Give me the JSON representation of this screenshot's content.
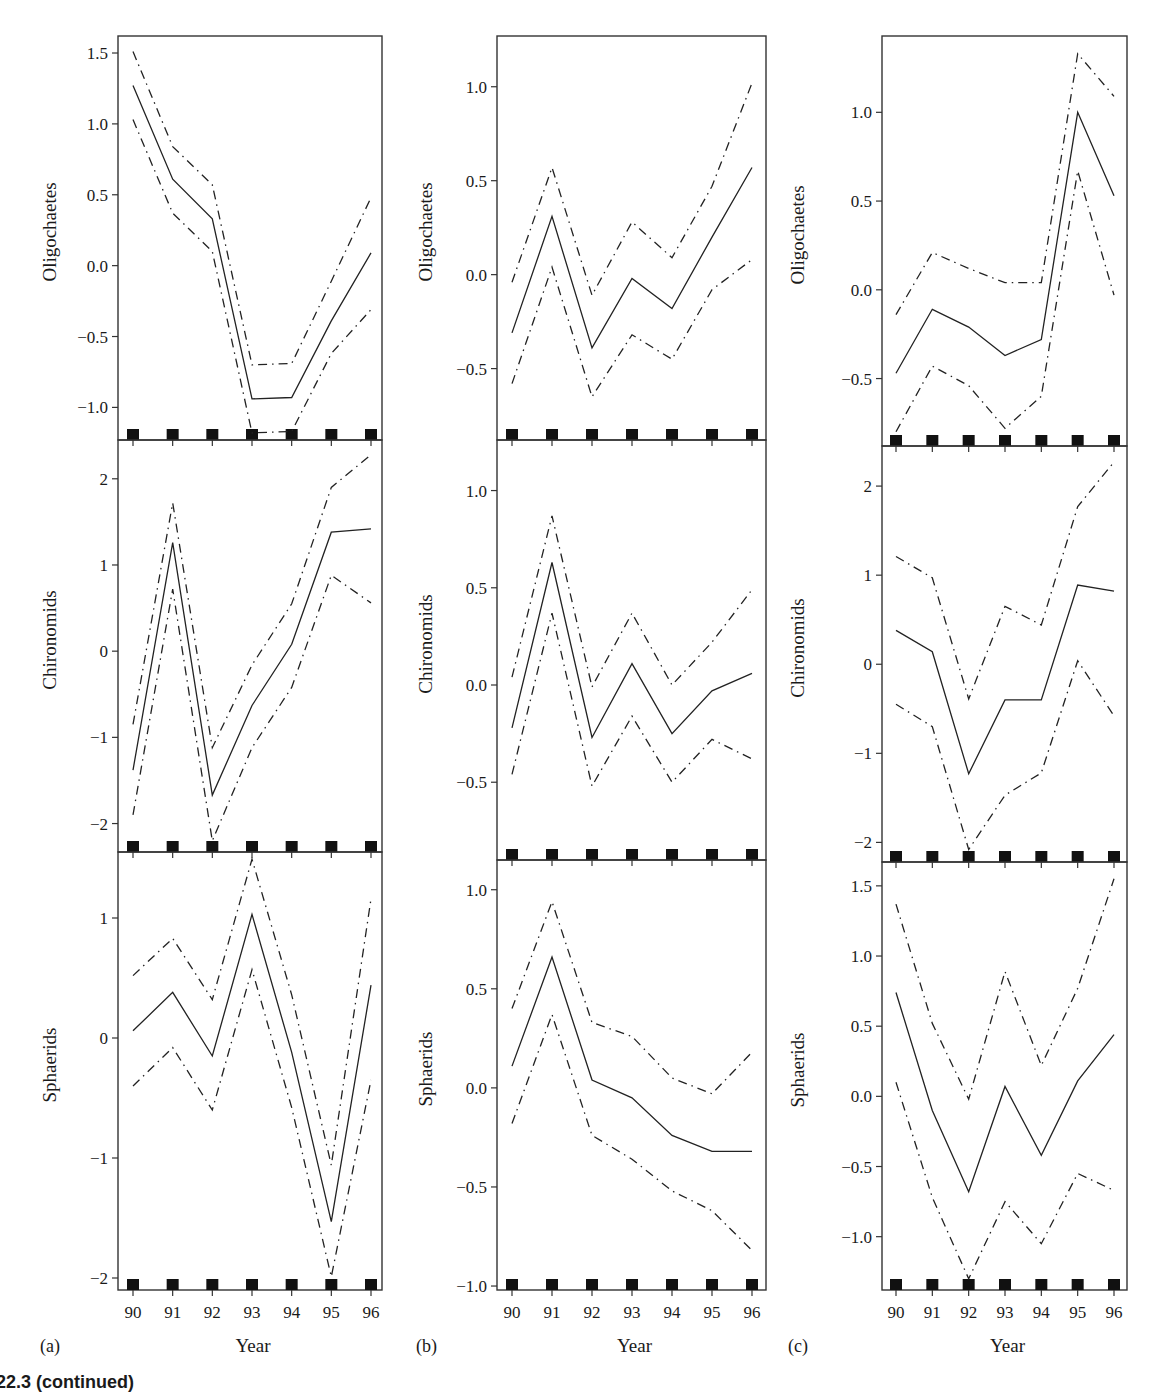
{
  "figure": {
    "caption": "22.3  (continued)",
    "xlabel": "Year",
    "panel_tags": [
      "(a)",
      "(b)",
      "(c)"
    ],
    "legend_styles": {
      "estimate": "solid",
      "upper_bound": "dash-dot",
      "lower_bound": "dash-dot"
    },
    "colors": {
      "line": "#222222",
      "frame": "#333333",
      "rug": "#111111"
    }
  },
  "chart_data": [
    {
      "type": "line",
      "column": "a",
      "row": 1,
      "ylabel": "Oligochaetes",
      "x": [
        90,
        91,
        92,
        93,
        94,
        95,
        96
      ],
      "yticks": [
        1.5,
        1.0,
        0.5,
        0.0,
        -0.5,
        -1.0
      ],
      "ytick_labels": [
        "1.5",
        "1.0",
        "0.5",
        "0.0",
        "−0.5",
        "−1.0"
      ],
      "ylim": [
        -1.23,
        1.62
      ],
      "series": [
        {
          "name": "estimate",
          "values": [
            1.27,
            0.61,
            0.33,
            -0.94,
            -0.93,
            -0.39,
            0.09
          ]
        },
        {
          "name": "upper",
          "values": [
            1.51,
            0.84,
            0.57,
            -0.7,
            -0.69,
            -0.11,
            0.48
          ]
        },
        {
          "name": "lower",
          "values": [
            1.03,
            0.37,
            0.1,
            -1.18,
            -1.17,
            -0.62,
            -0.31
          ]
        }
      ]
    },
    {
      "type": "line",
      "column": "b",
      "row": 1,
      "ylabel": "Oligochaetes",
      "x": [
        90,
        91,
        92,
        93,
        94,
        95,
        96
      ],
      "yticks": [
        1.0,
        0.5,
        0.0,
        -0.5
      ],
      "ytick_labels": [
        "1.0",
        "0.5",
        "0.0",
        "−0.5"
      ],
      "ylim": [
        -0.88,
        1.27
      ],
      "series": [
        {
          "name": "estimate",
          "values": [
            -0.31,
            0.31,
            -0.39,
            -0.02,
            -0.18,
            0.2,
            0.57
          ]
        },
        {
          "name": "upper",
          "values": [
            -0.04,
            0.57,
            -0.11,
            0.28,
            0.09,
            0.47,
            1.02
          ]
        },
        {
          "name": "lower",
          "values": [
            -0.58,
            0.04,
            -0.65,
            -0.32,
            -0.45,
            -0.08,
            0.08
          ]
        }
      ]
    },
    {
      "type": "line",
      "column": "c",
      "row": 1,
      "ylabel": "Oligochaetes",
      "x": [
        90,
        91,
        92,
        93,
        94,
        95,
        96
      ],
      "yticks": [
        1.0,
        0.5,
        0.0,
        -0.5
      ],
      "ytick_labels": [
        "1.0",
        "0.5",
        "0.0",
        "−0.5"
      ],
      "ylim": [
        -0.88,
        1.43
      ],
      "series": [
        {
          "name": "estimate",
          "values": [
            -0.47,
            -0.11,
            -0.21,
            -0.37,
            -0.28,
            1.0,
            0.53
          ]
        },
        {
          "name": "upper",
          "values": [
            -0.14,
            0.21,
            0.12,
            0.04,
            0.04,
            1.33,
            1.09
          ]
        },
        {
          "name": "lower",
          "values": [
            -0.8,
            -0.43,
            -0.54,
            -0.78,
            -0.6,
            0.67,
            -0.03
          ]
        }
      ]
    },
    {
      "type": "line",
      "column": "a",
      "row": 2,
      "ylabel": "Chironomids",
      "x": [
        90,
        91,
        92,
        93,
        94,
        95,
        96
      ],
      "yticks": [
        2,
        1,
        0,
        -1,
        -2
      ],
      "ytick_labels": [
        "2",
        "1",
        "0",
        "−1",
        "−2"
      ],
      "ylim": [
        -2.33,
        2.45
      ],
      "series": [
        {
          "name": "estimate",
          "values": [
            -1.38,
            1.26,
            -1.67,
            -0.63,
            0.08,
            1.38,
            1.42
          ]
        },
        {
          "name": "upper",
          "values": [
            -0.85,
            1.72,
            -1.12,
            -0.16,
            0.55,
            1.9,
            2.28
          ]
        },
        {
          "name": "lower",
          "values": [
            -1.9,
            0.72,
            -2.2,
            -1.12,
            -0.42,
            0.88,
            0.56
          ]
        }
      ]
    },
    {
      "type": "line",
      "column": "b",
      "row": 2,
      "ylabel": "Chironomids",
      "x": [
        90,
        91,
        92,
        93,
        94,
        95,
        96
      ],
      "yticks": [
        1.0,
        0.5,
        0.0,
        -0.5
      ],
      "ytick_labels": [
        "1.0",
        "0.5",
        "0.0",
        "−0.5"
      ],
      "ylim": [
        -0.9,
        1.26
      ],
      "series": [
        {
          "name": "estimate",
          "values": [
            -0.22,
            0.63,
            -0.27,
            0.11,
            -0.25,
            -0.03,
            0.06
          ]
        },
        {
          "name": "upper",
          "values": [
            0.04,
            0.87,
            -0.01,
            0.37,
            0.0,
            0.22,
            0.49
          ]
        },
        {
          "name": "lower",
          "values": [
            -0.46,
            0.37,
            -0.52,
            -0.16,
            -0.5,
            -0.28,
            -0.38
          ]
        }
      ]
    },
    {
      "type": "line",
      "column": "c",
      "row": 2,
      "ylabel": "Chironomids",
      "x": [
        90,
        91,
        92,
        93,
        94,
        95,
        96
      ],
      "yticks": [
        2,
        1,
        0,
        -1,
        -2
      ],
      "ytick_labels": [
        "2",
        "1",
        "0",
        "−1",
        "−2"
      ],
      "ylim": [
        -2.22,
        2.45
      ],
      "series": [
        {
          "name": "estimate",
          "values": [
            0.38,
            0.14,
            -1.23,
            -0.4,
            -0.4,
            0.89,
            0.82
          ]
        },
        {
          "name": "upper",
          "values": [
            1.21,
            0.97,
            -0.39,
            0.65,
            0.44,
            1.77,
            2.27
          ]
        },
        {
          "name": "lower",
          "values": [
            -0.45,
            -0.7,
            -2.08,
            -1.47,
            -1.22,
            0.04,
            -0.58
          ]
        }
      ]
    },
    {
      "type": "line",
      "column": "a",
      "row": 3,
      "ylabel": "Sphaerids",
      "x": [
        90,
        91,
        92,
        93,
        94,
        95,
        96
      ],
      "yticks": [
        1,
        0,
        -1,
        -2
      ],
      "ytick_labels": [
        "1",
        "0",
        "−1",
        "−2"
      ],
      "ylim": [
        -2.1,
        1.55
      ],
      "series": [
        {
          "name": "estimate",
          "values": [
            0.06,
            0.38,
            -0.15,
            1.03,
            -0.12,
            -1.53,
            0.44
          ]
        },
        {
          "name": "upper",
          "values": [
            0.52,
            0.83,
            0.32,
            1.49,
            0.36,
            -1.06,
            1.16
          ]
        },
        {
          "name": "lower",
          "values": [
            -0.4,
            -0.08,
            -0.6,
            0.57,
            -0.58,
            -1.99,
            -0.35
          ]
        }
      ]
    },
    {
      "type": "line",
      "column": "b",
      "row": 3,
      "ylabel": "Sphaerids",
      "x": [
        90,
        91,
        92,
        93,
        94,
        95,
        96
      ],
      "yticks": [
        1.0,
        0.5,
        0.0,
        -0.5,
        -1.0
      ],
      "ytick_labels": [
        "1.0",
        "0.5",
        "0.0",
        "−0.5",
        "−1.0"
      ],
      "ylim": [
        -1.02,
        1.15
      ],
      "series": [
        {
          "name": "estimate",
          "values": [
            0.11,
            0.66,
            0.04,
            -0.05,
            -0.24,
            -0.32,
            -0.32
          ]
        },
        {
          "name": "upper",
          "values": [
            0.4,
            0.94,
            0.33,
            0.26,
            0.05,
            -0.03,
            0.18
          ]
        },
        {
          "name": "lower",
          "values": [
            -0.18,
            0.37,
            -0.24,
            -0.36,
            -0.52,
            -0.62,
            -0.82
          ]
        }
      ]
    },
    {
      "type": "line",
      "column": "c",
      "row": 3,
      "ylabel": "Sphaerids",
      "x": [
        90,
        91,
        92,
        93,
        94,
        95,
        96
      ],
      "yticks": [
        1.5,
        1.0,
        0.5,
        0.0,
        -0.5,
        -1.0
      ],
      "ytick_labels": [
        "1.5",
        "1.0",
        "0.5",
        "0.0",
        "−0.5",
        "−1.0"
      ],
      "ylim": [
        -1.38,
        1.67
      ],
      "series": [
        {
          "name": "estimate",
          "values": [
            0.74,
            -0.1,
            -0.68,
            0.07,
            -0.42,
            0.11,
            0.44
          ]
        },
        {
          "name": "upper",
          "values": [
            1.37,
            0.52,
            -0.02,
            0.89,
            0.22,
            0.77,
            1.55
          ]
        },
        {
          "name": "lower",
          "values": [
            0.1,
            -0.72,
            -1.3,
            -0.75,
            -1.05,
            -0.55,
            -0.67
          ]
        }
      ]
    }
  ]
}
